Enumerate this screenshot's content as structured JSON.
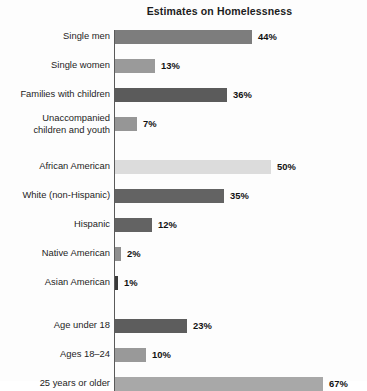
{
  "chart_data": {
    "type": "bar",
    "orientation": "horizontal",
    "title": "Estimates on Homelessness",
    "xlabel": "",
    "ylabel": "",
    "xlim": [
      0,
      67
    ],
    "grid": false,
    "legend": "none",
    "value_suffix": "%",
    "categories": [
      "Single men",
      "Single women",
      "Families with children",
      "Unaccompanied children and youth",
      "African American",
      "White (non-Hispanic)",
      "Hispanic",
      "Native American",
      "Asian American",
      "Age under 18",
      "Ages 18–24",
      "25 years or older"
    ],
    "values": [
      44,
      13,
      36,
      7,
      50,
      35,
      12,
      2,
      1,
      23,
      10,
      67
    ],
    "value_labels": [
      "44%",
      "13%",
      "36%",
      "7%",
      "50%",
      "35%",
      "12%",
      "2%",
      "1%",
      "23%",
      "10%",
      "67%"
    ],
    "bars": [
      {
        "label": "Single men",
        "label_lines": [
          "Single men"
        ],
        "value": 44,
        "value_label": "44%",
        "color": "#7d7d7d",
        "group": 1
      },
      {
        "label": "Single women",
        "label_lines": [
          "Single women"
        ],
        "value": 13,
        "value_label": "13%",
        "color": "#9a9a9a",
        "group": 1
      },
      {
        "label": "Families with children",
        "label_lines": [
          "Families with children"
        ],
        "value": 36,
        "value_label": "36%",
        "color": "#5b5b5b",
        "group": 1
      },
      {
        "label": "Unaccompanied children and youth",
        "label_lines": [
          "Unaccompanied",
          "children and youth"
        ],
        "value": 7,
        "value_label": "7%",
        "color": "#969696",
        "group": 1
      },
      {
        "label": "African American",
        "label_lines": [
          "African American"
        ],
        "value": 50,
        "value_label": "50%",
        "color": "#dcdcdc",
        "group": 2
      },
      {
        "label": "White (non-Hispanic)",
        "label_lines": [
          "White (non-Hispanic)"
        ],
        "value": 35,
        "value_label": "35%",
        "color": "#636363",
        "group": 2
      },
      {
        "label": "Hispanic",
        "label_lines": [
          "Hispanic"
        ],
        "value": 12,
        "value_label": "12%",
        "color": "#636363",
        "group": 2
      },
      {
        "label": "Native American",
        "label_lines": [
          "Native American"
        ],
        "value": 2,
        "value_label": "2%",
        "color": "#8f8f8f",
        "group": 2
      },
      {
        "label": "Asian American",
        "label_lines": [
          "Asian American"
        ],
        "value": 1,
        "value_label": "1%",
        "color": "#3a3a3a",
        "group": 2
      },
      {
        "label": "Age under 18",
        "label_lines": [
          "Age under 18"
        ],
        "value": 23,
        "value_label": "23%",
        "color": "#5d5d5d",
        "group": 3
      },
      {
        "label": "Ages 18–24",
        "label_lines": [
          "Ages 18–24"
        ],
        "value": 10,
        "value_label": "10%",
        "color": "#999999",
        "group": 3
      },
      {
        "label": "25 years or older",
        "label_lines": [
          "25 years or older"
        ],
        "value": 67,
        "value_label": "67%",
        "color": "#a8a8a8",
        "group": 3
      }
    ],
    "groups": [
      {
        "id": 1,
        "name": "household-type",
        "bar_indexes": [
          0,
          1,
          2,
          3
        ]
      },
      {
        "id": 2,
        "name": "race-ethnicity",
        "bar_indexes": [
          4,
          5,
          6,
          7,
          8
        ]
      },
      {
        "id": 3,
        "name": "age",
        "bar_indexes": [
          9,
          10,
          11
        ]
      }
    ]
  },
  "layout": {
    "axis_x": 114,
    "bar_origin_x": 115,
    "px_per_percent": 3.11,
    "bar_height": 14,
    "row_pitch": 29,
    "group_gap": 14,
    "value_gap": 6,
    "row_tops": [
      8,
      37,
      66,
      95,
      138,
      167,
      196,
      225,
      254,
      297,
      326,
      355
    ]
  }
}
